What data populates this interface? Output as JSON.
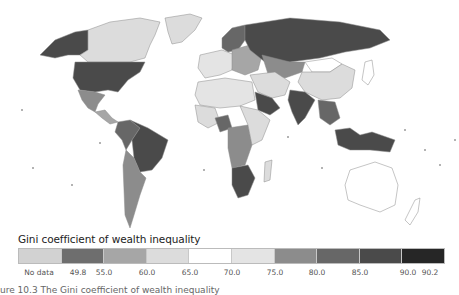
{
  "legend": {
    "title": "Gini coefficient of wealth inequality",
    "bins": [
      {
        "label": "No data",
        "color": "#d2d2d2"
      },
      {
        "label": "49.8–55.0",
        "color": "#6e6e6e"
      },
      {
        "label": "55.0–60.0",
        "color": "#a6a6a6"
      },
      {
        "label": "60.0–65.0",
        "color": "#dcdcdc"
      },
      {
        "label": "65.0–70.0",
        "color": "#ffffff"
      },
      {
        "label": "70.0–75.0",
        "color": "#e4e4e4"
      },
      {
        "label": "75.0–80.0",
        "color": "#8c8c8c"
      },
      {
        "label": "80.0–85.0",
        "color": "#676767"
      },
      {
        "label": "85.0–90.0",
        "color": "#4a4a4a"
      },
      {
        "label": "90.0–90.2",
        "color": "#262626"
      }
    ],
    "tick_labels": [
      "No data",
      "49.8",
      "55.0",
      "60.0",
      "65.0",
      "70.0",
      "75.0",
      "80.0",
      "85.0",
      "90.0",
      "90.2"
    ]
  },
  "map": {
    "regions": [
      {
        "name": "Alaska",
        "color": "#4a4a4a"
      },
      {
        "name": "Canada",
        "color": "#dcdcdc"
      },
      {
        "name": "Greenland",
        "color": "#dcdcdc"
      },
      {
        "name": "United States",
        "color": "#4a4a4a"
      },
      {
        "name": "Mexico",
        "color": "#8c8c8c"
      },
      {
        "name": "Central America",
        "color": "#a6a6a6"
      },
      {
        "name": "Brazil",
        "color": "#4a4a4a"
      },
      {
        "name": "Andean South America",
        "color": "#676767"
      },
      {
        "name": "Southern Cone",
        "color": "#8c8c8c"
      },
      {
        "name": "Scandinavia",
        "color": "#676767"
      },
      {
        "name": "Western Europe",
        "color": "#e4e4e4"
      },
      {
        "name": "Eastern Europe",
        "color": "#a6a6a6"
      },
      {
        "name": "Russia",
        "color": "#4a4a4a"
      },
      {
        "name": "Kazakhstan",
        "color": "#8c8c8c"
      },
      {
        "name": "Mongolia",
        "color": "#ffffff"
      },
      {
        "name": "China",
        "color": "#dcdcdc"
      },
      {
        "name": "Japan",
        "color": "#ffffff"
      },
      {
        "name": "Middle East",
        "color": "#dcdcdc"
      },
      {
        "name": "Saudi Arabia",
        "color": "#4a4a4a"
      },
      {
        "name": "India",
        "color": "#4a4a4a"
      },
      {
        "name": "Southeast Asia",
        "color": "#676767"
      },
      {
        "name": "Indonesia",
        "color": "#4a4a4a"
      },
      {
        "name": "North Africa",
        "color": "#e4e4e4"
      },
      {
        "name": "West Africa",
        "color": "#dcdcdc"
      },
      {
        "name": "Nigeria",
        "color": "#676767"
      },
      {
        "name": "Central Africa",
        "color": "#8c8c8c"
      },
      {
        "name": "East Africa",
        "color": "#dcdcdc"
      },
      {
        "name": "Southern Africa",
        "color": "#4a4a4a"
      },
      {
        "name": "Madagascar",
        "color": "#dcdcdc"
      },
      {
        "name": "Australia",
        "color": "#ffffff"
      },
      {
        "name": "New Zealand",
        "color": "#ffffff"
      }
    ]
  },
  "caption": "ure 10.3 The Gini coefficient of wealth inequality"
}
